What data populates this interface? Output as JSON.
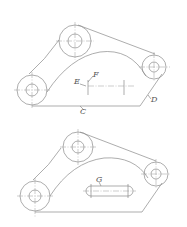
{
  "diagram": {
    "type": "mechanical-drawing",
    "views": [
      {
        "name": "top-view",
        "labels": {
          "E": "E",
          "F": "F",
          "C": "C",
          "D": "D"
        }
      },
      {
        "name": "bottom-view",
        "labels": {
          "G": "G"
        }
      }
    ]
  },
  "colors": {
    "line": "#8a8a8a",
    "label": "#555555",
    "background": "#ffffff"
  }
}
